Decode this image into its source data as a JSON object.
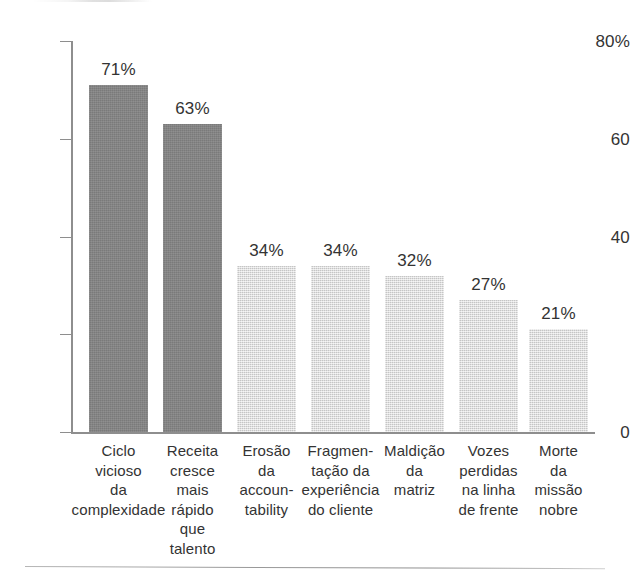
{
  "chart_data": {
    "type": "bar",
    "title": "",
    "subtitle": "",
    "xlabel": "",
    "ylabel": "",
    "ylim": [
      0,
      80
    ],
    "grid": false,
    "legend": "none",
    "y_ticks": [
      {
        "value": 80,
        "label": "80%"
      },
      {
        "value": 60,
        "label": "60"
      },
      {
        "value": 40,
        "label": "40"
      },
      {
        "value": 20,
        "label": ""
      },
      {
        "value": 0,
        "label": "0"
      }
    ],
    "categories": [
      "Ciclo\nvicioso\nda\ncomplexidade",
      "Receita\ncresce\nmais\nrápido\nque\ntalento",
      "Erosão\nda\naccoun-\ntability",
      "Fragmen-\ntação da\nexperiência\ndo cliente",
      "Maldição\nda\nmatriz",
      "Vozes\nperdidas\nna linha\nde frente",
      "Morte\nda\nmissão\nnobre"
    ],
    "values": [
      71,
      63,
      34,
      34,
      32,
      27,
      21
    ],
    "value_labels": [
      "71%",
      "63%",
      "34%",
      "34%",
      "32%",
      "27%",
      "21%"
    ],
    "bar_colors": [
      "#838383",
      "#838383",
      "#d6d6d6",
      "#d6d6d6",
      "#d6d6d6",
      "#d6d6d6",
      "#d6d6d6"
    ],
    "bar_styles": [
      "dark",
      "dark",
      "light",
      "light",
      "light",
      "light",
      "light"
    ],
    "axis_color": "#8e8e8e",
    "text_color": "#333333",
    "background": "#ffffff"
  },
  "layout": {
    "axis_left_px": 71,
    "axis_top_px": 41,
    "axis_baseline_px": 432,
    "axis_right_px": 595,
    "bar_width_px": 59,
    "bar_starts_px": [
      89,
      163,
      237,
      311,
      385,
      459,
      529
    ],
    "cat_label_width_px": 100
  }
}
